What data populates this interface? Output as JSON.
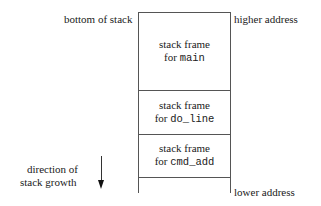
{
  "labels": {
    "bottom_of_stack": "bottom of stack",
    "higher_address": "higher address",
    "lower_address": "lower address",
    "direction_line1": "direction of",
    "direction_line2": "stack growth"
  },
  "frames": [
    {
      "line1": "stack frame",
      "prefix": "for ",
      "func": "main"
    },
    {
      "line1": "stack frame",
      "prefix": "for ",
      "func": "do_line"
    },
    {
      "line1": "stack frame",
      "prefix": "for ",
      "func": "cmd_add"
    }
  ],
  "icons": {
    "arrow": "down-arrow-icon"
  }
}
